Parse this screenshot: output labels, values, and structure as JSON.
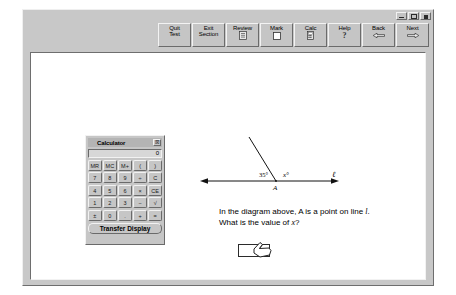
{
  "window": {
    "controls": [
      {
        "name": "minimize",
        "label": "_"
      },
      {
        "name": "maximize",
        "label": "□"
      },
      {
        "name": "close",
        "label": "×"
      }
    ]
  },
  "toolbar": {
    "buttons": [
      {
        "id": "quit-test",
        "line1": "Quit",
        "line2": "Test",
        "icon": ""
      },
      {
        "id": "exit-section",
        "line1": "Exit",
        "line2": "Section",
        "icon": ""
      },
      {
        "id": "review",
        "line1": "Review",
        "line2": "",
        "icon": "list-icon"
      },
      {
        "id": "mark",
        "line1": "Mark",
        "line2": "",
        "icon": "checkbox-icon"
      },
      {
        "id": "calc",
        "line1": "Calc",
        "line2": "",
        "icon": "calculator-icon"
      },
      {
        "id": "help",
        "line1": "Help",
        "line2": "",
        "icon": "question-icon"
      },
      {
        "id": "back",
        "line1": "Back",
        "line2": "",
        "icon": "arrow-left-icon"
      },
      {
        "id": "next",
        "line1": "Next",
        "line2": "",
        "icon": "arrow-right-icon"
      }
    ]
  },
  "calculator": {
    "title": "Calculator",
    "close_label": "☒",
    "display_value": "0",
    "transfer_label": "Transfer Display",
    "rows": [
      [
        "MR",
        "MC",
        "M+",
        "(",
        ")"
      ],
      [
        "7",
        "8",
        "9",
        "÷",
        "C"
      ],
      [
        "4",
        "5",
        "6",
        "×",
        "CE"
      ],
      [
        "1",
        "2",
        "3",
        "−",
        "√"
      ],
      [
        "±",
        "0",
        ".",
        "+",
        "="
      ]
    ]
  },
  "diagram": {
    "angle_left_label": "35°",
    "angle_right_label": "x°",
    "point_label": "A",
    "line_label": "ℓ"
  },
  "question": {
    "line1_pre": "In the diagram above, A is a point on line ",
    "line1_italic": "l",
    "line1_post": ".",
    "line2_pre": "What is the value of ",
    "line2_italic": "x",
    "line2_post": "?"
  },
  "answer": {
    "value": "",
    "placeholder": ""
  },
  "footer": {
    "instruction": "Click on the box and type in your answer."
  },
  "colors": {
    "window_face": "#c8c8c8",
    "page_white": "#ffffff",
    "button_face": "#c5c5c5",
    "ink": "#000000"
  }
}
